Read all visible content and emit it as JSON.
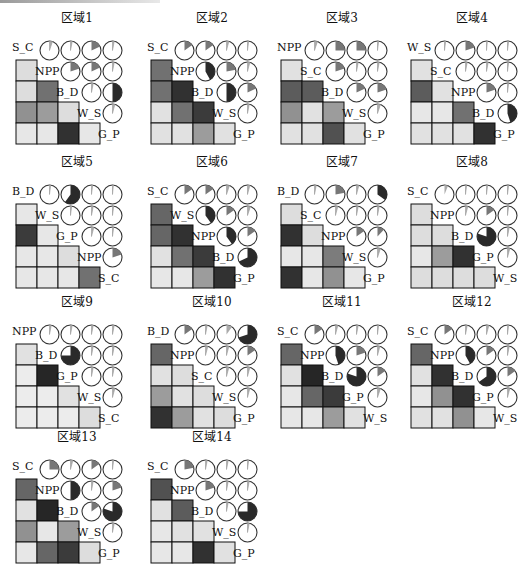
{
  "figure": {
    "colors": {
      "square_outline": "#111111",
      "circle_outline": "#222222",
      "pos_fill_strong": "#1e1e1e",
      "pos_fill_mid": "#6a6a6a",
      "pos_fill_light": "#b0b0b0",
      "empty_square": "#f2f2f2"
    }
  },
  "chart_data": [
    {
      "type": "heatmap",
      "title": "区域1",
      "variables": [
        "S_C",
        "NPP",
        "B_D",
        "W_S",
        "G_P"
      ],
      "upper_pie": [
        [
          0.05,
          0.03,
          0.18,
          0.03
        ],
        [
          0.2,
          0.18,
          0.03
        ],
        [
          0.03,
          0.5
        ],
        [
          0.04
        ]
      ],
      "lower_shade": [
        [
          0.1
        ],
        [
          0.1,
          0.6
        ],
        [
          0.45,
          0.4,
          0.1
        ],
        [
          0.05,
          0.05,
          0.9,
          0.05
        ]
      ]
    },
    {
      "type": "heatmap",
      "title": "区域2",
      "variables": [
        "S_C",
        "NPP",
        "B_D",
        "W_S",
        "G_P"
      ],
      "upper_pie": [
        [
          0.15,
          0.15,
          0.04,
          0.02
        ],
        [
          0.42,
          0.22,
          0.04
        ],
        [
          0.5,
          0.18
        ],
        [
          0.03
        ]
      ],
      "lower_shade": [
        [
          0.6
        ],
        [
          0.6,
          0.9
        ],
        [
          0.08,
          0.6,
          0.85
        ],
        [
          0.08,
          0.08,
          0.4,
          0.08
        ]
      ]
    },
    {
      "type": "heatmap",
      "title": "区域3",
      "variables": [
        "NPP",
        "S_C",
        "B_D",
        "W_S",
        "G_P"
      ],
      "upper_pie": [
        [
          0.05,
          0.25,
          0.25,
          0.02
        ],
        [
          0.2,
          0.03,
          0.03
        ],
        [
          0.18,
          0.2
        ],
        [
          0.05
        ]
      ],
      "lower_shade": [
        [
          0.08
        ],
        [
          0.7,
          0.7
        ],
        [
          0.45,
          0.08,
          0.4
        ],
        [
          0.08,
          0.08,
          0.75,
          0.08
        ]
      ]
    },
    {
      "type": "heatmap",
      "title": "区域4",
      "variables": [
        "W_S",
        "S_C",
        "NPP",
        "B_D",
        "G_P"
      ],
      "upper_pie": [
        [
          0.02,
          0.2,
          0.0,
          0.02
        ],
        [
          0.03,
          0.03,
          0.02
        ],
        [
          0.2,
          0.02
        ],
        [
          0.45
        ]
      ],
      "lower_shade": [
        [
          0.08
        ],
        [
          0.7,
          0.08
        ],
        [
          0.05,
          0.05,
          0.6
        ],
        [
          0.08,
          0.08,
          0.08,
          0.9
        ]
      ]
    },
    {
      "type": "heatmap",
      "title": "区域5",
      "variables": [
        "B_D",
        "W_S",
        "G_P",
        "NPP",
        "S_C"
      ],
      "upper_pie": [
        [
          0.02,
          0.6,
          0.02,
          0.0
        ],
        [
          0.02,
          0.03,
          0.02
        ],
        [
          0.04,
          0.02
        ],
        [
          0.2
        ]
      ],
      "lower_shade": [
        [
          0.05
        ],
        [
          0.85,
          0.05
        ],
        [
          0.05,
          0.05,
          0.1
        ],
        [
          0.05,
          0.05,
          0.05,
          0.6
        ]
      ]
    },
    {
      "type": "heatmap",
      "title": "区域6",
      "variables": [
        "S_C",
        "W_S",
        "NPP",
        "B_D",
        "G_P"
      ],
      "upper_pie": [
        [
          0.15,
          0.15,
          0.05,
          0.04
        ],
        [
          0.4,
          0.15,
          0.05
        ],
        [
          0.4,
          0.15
        ],
        [
          0.68
        ]
      ],
      "lower_shade": [
        [
          0.65
        ],
        [
          0.65,
          0.9
        ],
        [
          0.08,
          0.6,
          0.85
        ],
        [
          0.05,
          0.05,
          0.4,
          0.9
        ]
      ]
    },
    {
      "type": "heatmap",
      "title": "区域7",
      "variables": [
        "B_D",
        "S_C",
        "NPP",
        "W_S",
        "G_P"
      ],
      "upper_pie": [
        [
          0.03,
          0.22,
          0.04,
          0.35
        ],
        [
          0.04,
          0.03,
          0.03
        ],
        [
          0.15,
          0.12
        ],
        [
          0.05
        ]
      ],
      "lower_shade": [
        [
          0.1
        ],
        [
          0.9,
          0.1
        ],
        [
          0.05,
          0.05,
          0.55
        ],
        [
          0.9,
          0.05,
          0.45,
          0.05
        ]
      ]
    },
    {
      "type": "heatmap",
      "title": "区域8",
      "variables": [
        "S_C",
        "NPP",
        "B_D",
        "G_P",
        "W_S"
      ],
      "upper_pie": [
        [
          0.06,
          0.02,
          0.02,
          0.02
        ],
        [
          0.04,
          0.15,
          0.02
        ],
        [
          0.8,
          0.03
        ],
        [
          0.04
        ]
      ],
      "lower_shade": [
        [
          0.1
        ],
        [
          0.1,
          0.1
        ],
        [
          0.05,
          0.4,
          0.9
        ],
        [
          0.1,
          0.1,
          0.1,
          0.1
        ]
      ]
    },
    {
      "type": "heatmap",
      "title": "区域9",
      "variables": [
        "NPP",
        "B_D",
        "G_P",
        "W_S",
        "S_C"
      ],
      "upper_pie": [
        [
          0.03,
          0.03,
          0.03,
          0.03
        ],
        [
          0.75,
          0.03,
          0.03
        ],
        [
          0.03,
          0.03
        ],
        [
          0.04
        ]
      ],
      "lower_shade": [
        [
          0.08
        ],
        [
          0.03,
          0.95
        ],
        [
          0.03,
          0.03,
          0.08
        ],
        [
          0.03,
          0.03,
          0.03,
          0.1
        ]
      ]
    },
    {
      "type": "heatmap",
      "title": "区域10",
      "variables": [
        "B_D",
        "NPP",
        "S_C",
        "W_S",
        "G_P"
      ],
      "upper_pie": [
        [
          0.15,
          0.03,
          0.1,
          0.7
        ],
        [
          0.04,
          0.04,
          0.15
        ],
        [
          0.04,
          0.04
        ],
        [
          0.04
        ]
      ],
      "lower_shade": [
        [
          0.65
        ],
        [
          0.08,
          0.1
        ],
        [
          0.4,
          0.08,
          0.1
        ],
        [
          0.9,
          0.4,
          0.08,
          0.1
        ]
      ]
    },
    {
      "type": "heatmap",
      "title": "区域11",
      "variables": [
        "S_C",
        "NPP",
        "B_D",
        "G_P",
        "W_S"
      ],
      "upper_pie": [
        [
          0.15,
          0.04,
          0.03,
          0.02
        ],
        [
          0.45,
          0.2,
          0.04
        ],
        [
          0.8,
          0.15
        ],
        [
          0.05
        ]
      ],
      "lower_shade": [
        [
          0.65
        ],
        [
          0.08,
          0.95
        ],
        [
          0.05,
          0.65,
          0.85
        ],
        [
          0.05,
          0.05,
          0.4,
          0.08
        ]
      ]
    },
    {
      "type": "heatmap",
      "title": "区域12",
      "variables": [
        "S_C",
        "NPP",
        "B_D",
        "G_P",
        "W_S"
      ],
      "upper_pie": [
        [
          0.15,
          0.03,
          0.04,
          0.02
        ],
        [
          0.42,
          0.15,
          0.03
        ],
        [
          0.65,
          0.15
        ],
        [
          0.04
        ]
      ],
      "lower_shade": [
        [
          0.65
        ],
        [
          0.08,
          0.9
        ],
        [
          0.05,
          0.45,
          0.9
        ],
        [
          0.08,
          0.08,
          0.45,
          0.05
        ]
      ]
    },
    {
      "type": "heatmap",
      "title": "区域13",
      "variables": [
        "S_C",
        "NPP",
        "B_D",
        "W_S",
        "G_P"
      ],
      "upper_pie": [
        [
          0.25,
          0.04,
          0.15,
          0.02
        ],
        [
          0.5,
          0.03,
          0.2
        ],
        [
          0.15,
          0.8
        ],
        [
          0.03
        ]
      ],
      "lower_shade": [
        [
          0.65
        ],
        [
          0.08,
          0.95
        ],
        [
          0.45,
          0.05,
          0.4
        ],
        [
          0.05,
          0.65,
          0.85,
          0.1
        ]
      ]
    },
    {
      "type": "heatmap",
      "title": "区域14",
      "variables": [
        "S_C",
        "NPP",
        "B_D",
        "W_S",
        "G_P"
      ],
      "upper_pie": [
        [
          0.22,
          0.03,
          0.03,
          0.02
        ],
        [
          0.2,
          0.03,
          0.03
        ],
        [
          0.03,
          0.75
        ],
        [
          0.03
        ]
      ],
      "lower_shade": [
        [
          0.75
        ],
        [
          0.08,
          0.7
        ],
        [
          0.05,
          0.08,
          0.08
        ],
        [
          0.05,
          0.05,
          0.9,
          0.08
        ]
      ]
    }
  ],
  "layout": {
    "positions": [
      [
        0,
        8
      ],
      [
        135,
        8
      ],
      [
        265,
        8
      ],
      [
        395,
        8
      ],
      [
        0,
        152
      ],
      [
        135,
        152
      ],
      [
        265,
        152
      ],
      [
        395,
        152
      ],
      [
        0,
        292
      ],
      [
        135,
        292
      ],
      [
        265,
        292
      ],
      [
        395,
        292
      ],
      [
        0,
        427
      ],
      [
        135,
        427
      ]
    ]
  }
}
